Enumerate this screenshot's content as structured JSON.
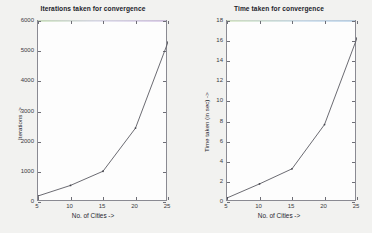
{
  "figures": [
    {
      "id": "iterations",
      "title": "Iterations taken for convergence",
      "xlabel": "No. of Cities ->",
      "ylabel": "Iterations ->",
      "xticks": [
        "5",
        "10",
        "15",
        "20",
        "25"
      ],
      "yticks": [
        "0",
        "1000",
        "2000",
        "3000",
        "4000",
        "5000",
        "6000"
      ]
    },
    {
      "id": "time",
      "title": "Time taken for convergence",
      "xlabel": "No. of Cities ->",
      "ylabel": "Time taken (in sec) ->",
      "xticks": [
        "5",
        "10",
        "15",
        "20",
        "25"
      ],
      "yticks": [
        "0",
        "2",
        "4",
        "6",
        "8",
        "10",
        "12",
        "14",
        "16",
        "18"
      ]
    }
  ],
  "chart_data": [
    {
      "type": "line",
      "title": "Iterations taken for convergence",
      "xlabel": "No. of Cities ->",
      "ylabel": "Iterations ->",
      "x": [
        5,
        10,
        15,
        20,
        25
      ],
      "values": [
        200,
        550,
        1020,
        2450,
        5300
      ],
      "xlim": [
        5,
        25
      ],
      "ylim": [
        0,
        6000
      ],
      "xticks": [
        5,
        10,
        15,
        20,
        25
      ],
      "yticks": [
        0,
        1000,
        2000,
        3000,
        4000,
        5000,
        6000
      ],
      "grid": false,
      "legend": null,
      "markers": true,
      "line_color": "#5a5a62"
    },
    {
      "type": "line",
      "title": "Time taken for convergence",
      "xlabel": "No. of Cities ->",
      "ylabel": "Time taken (in sec) ->",
      "x": [
        5,
        10,
        15,
        20,
        25
      ],
      "values": [
        0.4,
        1.8,
        3.3,
        7.7,
        16.3
      ],
      "xlim": [
        5,
        25
      ],
      "ylim": [
        0,
        18
      ],
      "xticks": [
        5,
        10,
        15,
        20,
        25
      ],
      "yticks": [
        0,
        2,
        4,
        6,
        8,
        10,
        12,
        14,
        16,
        18
      ],
      "grid": false,
      "legend": null,
      "markers": true,
      "line_color": "#5a5a62"
    }
  ]
}
